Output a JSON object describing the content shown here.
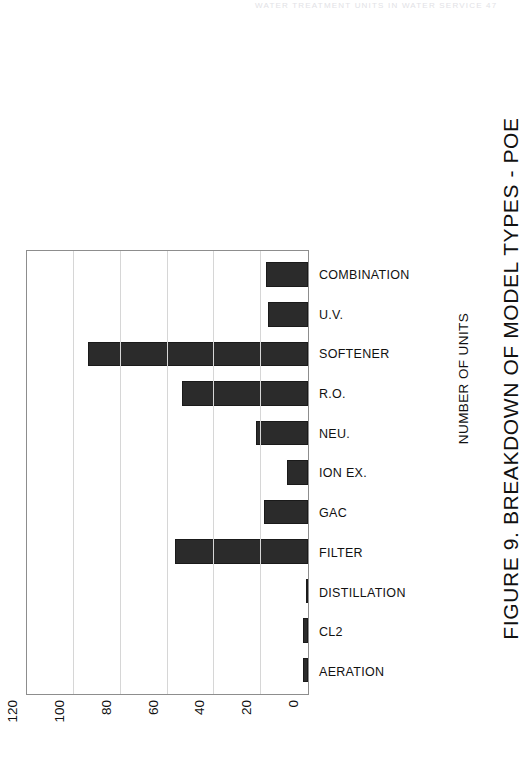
{
  "scan_header": {
    "text": "WATER TREATMENT UNITS IN WATER SERVICE 47"
  },
  "figure": {
    "title": "FIGURE 9. BREAKDOWN OF MODEL TYPES - POE",
    "axis_title": "NUMBER OF UNITS",
    "orientation": "rotated-90"
  },
  "colors": {
    "bar_fill": "#2b2b2b",
    "bar_stroke": "#1a1a1a",
    "gridline": "#d6d6d6",
    "axis_border": "#8d8d8d",
    "text": "#111111",
    "background": "#ffffff"
  },
  "chart_data": {
    "type": "bar",
    "title": "FIGURE 9. BREAKDOWN OF MODEL TYPES - POE",
    "xlabel": "",
    "ylabel": "NUMBER OF UNITS",
    "ylim": [
      0,
      120
    ],
    "yticks": [
      0,
      20,
      40,
      60,
      80,
      100,
      120
    ],
    "grid": true,
    "legend": false,
    "categories": [
      "AERATION",
      "CL2",
      "DISTILLATION",
      "FILTER",
      "GAC",
      "ION EX.",
      "NEU.",
      "R.O.",
      "SOFTENER",
      "U.V.",
      "COMBINATION"
    ],
    "values": [
      2,
      2,
      1,
      57,
      19,
      9,
      22,
      54,
      94,
      17,
      18
    ]
  }
}
